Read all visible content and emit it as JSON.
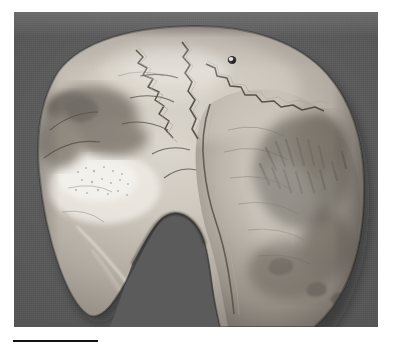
{
  "figure": {
    "kind": "photograph",
    "modality": "black-and-white photograph",
    "caption": "",
    "plate": {
      "background_color": "#5b5b5b",
      "page_color": "#ffffff",
      "left": 14,
      "top": 12,
      "width": 364,
      "height": 315
    },
    "scale_bar": {
      "label": "",
      "color": "#101010",
      "left": 13,
      "top": 340,
      "width": 85,
      "height": 2
    },
    "specimen": {
      "name": "calvaria",
      "bone_light_color": "#d9d5ce",
      "bone_mid_color": "#a9a49c",
      "bone_shadow_color": "#6e6a64",
      "bone_highlight_color": "#f2efe9",
      "features": [
        {
          "name": "coronal-suture",
          "description": "serrated suture crossing the upper-left quadrant"
        },
        {
          "name": "sagittal-suture",
          "description": "midline suture running front to back along the vertex"
        },
        {
          "name": "lambdoid-suture",
          "description": "suture arcing across the upper-right quadrant"
        },
        {
          "name": "parietal-foramen",
          "description": "small dark perforation near the vertex, right of midline"
        },
        {
          "name": "inferior-defect",
          "description": "large V-shaped break / missing segment at the lower middle margin"
        },
        {
          "name": "taphonomic-staining",
          "description": "dark mottled mineral staining across the left and right flanks"
        },
        {
          "name": "eroded-patch",
          "description": "bright stippled eroded area on the left flank"
        }
      ]
    }
  }
}
